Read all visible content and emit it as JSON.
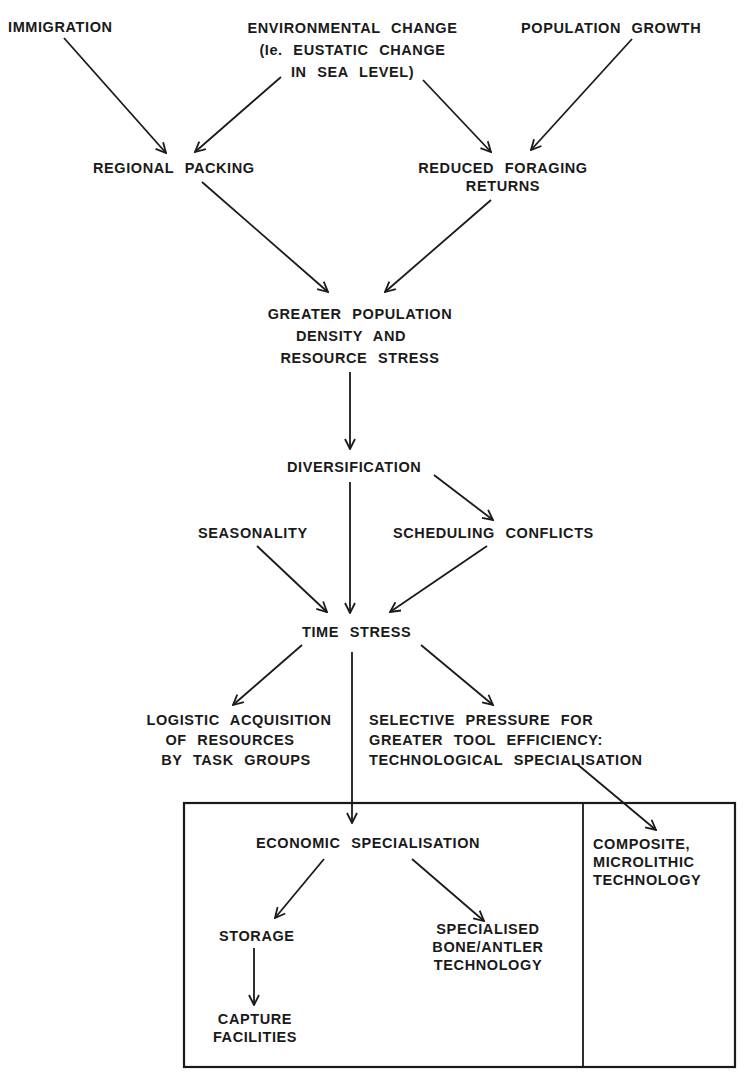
{
  "diagram": {
    "nodes": {
      "immigration": "IMMIGRATION",
      "environmental_change": [
        "ENVIRONMENTAL CHANGE",
        "(Ie. EUSTATIC CHANGE",
        "IN SEA LEVEL)"
      ],
      "population_growth": "POPULATION GROWTH",
      "regional_packing": "REGIONAL PACKING",
      "reduced_foraging_returns": [
        "REDUCED FORAGING",
        "RETURNS"
      ],
      "greater_population_density": [
        "GREATER POPULATION",
        "DENSITY AND",
        "RESOURCE STRESS"
      ],
      "diversification": "DIVERSIFICATION",
      "seasonality": "SEASONALITY",
      "scheduling_conflicts": "SCHEDULING CONFLICTS",
      "time_stress": "TIME STRESS",
      "logistic_acquisition": [
        "LOGISTIC ACQUISITION",
        "OF RESOURCES",
        "BY TASK GROUPS"
      ],
      "selective_pressure": [
        "SELECTIVE PRESSURE FOR",
        "GREATER TOOL EFFICIENCY:",
        "TECHNOLOGICAL SPECIALISATION"
      ],
      "economic_specialisation": "ECONOMIC SPECIALISATION",
      "storage": "STORAGE",
      "specialised_bone_antler": [
        "SPECIALISED",
        "BONE/ANTLER",
        "TECHNOLOGY"
      ],
      "capture_facilities": [
        "CAPTURE",
        "FACILITIES"
      ],
      "composite_microlithic": [
        "COMPOSITE,",
        "MICROLITHIC",
        "TECHNOLOGY"
      ]
    },
    "edges": [
      {
        "from": "immigration",
        "to": "regional_packing"
      },
      {
        "from": "environmental_change",
        "to": "regional_packing"
      },
      {
        "from": "environmental_change",
        "to": "reduced_foraging_returns"
      },
      {
        "from": "population_growth",
        "to": "reduced_foraging_returns"
      },
      {
        "from": "regional_packing",
        "to": "greater_population_density"
      },
      {
        "from": "reduced_foraging_returns",
        "to": "greater_population_density"
      },
      {
        "from": "greater_population_density",
        "to": "diversification"
      },
      {
        "from": "diversification",
        "to": "scheduling_conflicts"
      },
      {
        "from": "diversification",
        "to": "time_stress"
      },
      {
        "from": "seasonality",
        "to": "time_stress"
      },
      {
        "from": "scheduling_conflicts",
        "to": "time_stress"
      },
      {
        "from": "time_stress",
        "to": "logistic_acquisition"
      },
      {
        "from": "time_stress",
        "to": "selective_pressure"
      },
      {
        "from": "time_stress",
        "to": "economic_specialisation"
      },
      {
        "from": "selective_pressure",
        "to": "composite_microlithic"
      },
      {
        "from": "economic_specialisation",
        "to": "storage"
      },
      {
        "from": "economic_specialisation",
        "to": "specialised_bone_antler"
      },
      {
        "from": "storage",
        "to": "capture_facilities"
      }
    ],
    "colors": {
      "ink": "#1a1a1a",
      "background": "#ffffff"
    }
  }
}
